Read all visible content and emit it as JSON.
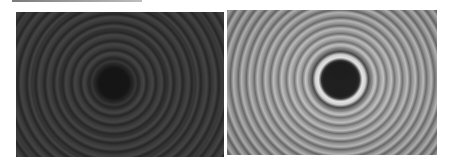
{
  "figure": {
    "panels": [
      {
        "id": "left",
        "description": "Low-contrast dark interference ring pattern (Newton's rings) with dark central spot",
        "tone": "dark",
        "center_spot_color": "#141414",
        "ring_colors": [
          "#2a2a2a",
          "#444444"
        ]
      },
      {
        "id": "right",
        "description": "High-contrast interference ring pattern with black central spot and bright first ring",
        "tone": "light",
        "center_spot_color": "#000000",
        "ring_colors": [
          "#6e6e6e",
          "#c8c8c8",
          "#e8e8e8"
        ]
      }
    ]
  }
}
